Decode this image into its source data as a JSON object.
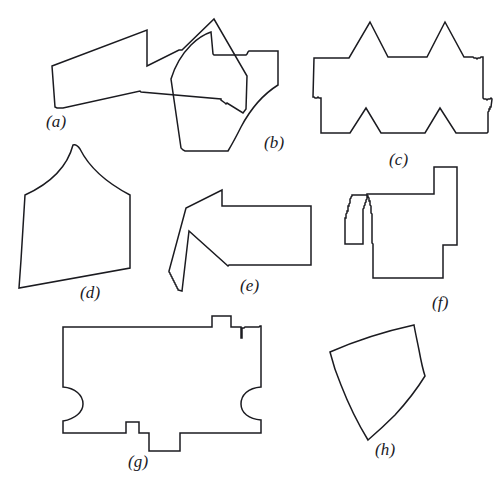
{
  "figure": {
    "background_color": "#ffffff",
    "stroke_color": "#1b1b20",
    "stroke_width": 1.5,
    "width": 501,
    "height": 491
  },
  "shapes": [
    {
      "id": "a",
      "caption": "(a)",
      "name": "notched-polygon",
      "description": "Irregular polygon with a deep V notch at the top",
      "caption_x": 46,
      "caption_y": 112,
      "path": "M 52 66 L 147 30 L 147 66 L 179 50 L 182 50 L 214 19 L 247 76 L 246 109 L 243 113 L 227 103 L 226 104 L 225 103 L 221 100 L 221 99 L 141 92 L 140 91 L 63 108 L 57 108 L 55 107 Z"
    },
    {
      "id": "b",
      "caption": "(b)",
      "name": "curved-notched-polygon",
      "description": "Polygon with concave right curve and a narrow slit at the top left",
      "caption_x": 264,
      "caption_y": 133,
      "path": "M 211 32 L 213 54 L 214 55 L 246 55 L 247 54 L 248 52 L 249 51 L 278 51 L 278 85 C 262 95 250 110 241 127 C 235 139 231 146 228 151 L 185 151 L 183 150 L 181 148 L 171 79 C 175 66 182 54 191 45 C 198 38 205 34 211 32 Z"
    },
    {
      "id": "c",
      "caption": "(c)",
      "name": "star-gear-polygon",
      "description": "Spiky star/gear-like rectilinear polygon with triangular teeth",
      "caption_x": 389,
      "caption_y": 150,
      "path": "M 370 22 L 388 57 L 427 57 L 445 22 L 464 57 L 473 57 L 474 58 L 476 58 L 477 59 L 478 58 L 480 58 L 481 57 L 483 57 L 483 98 L 484 99 L 486 99 L 487 100 L 488 99 L 490 99 L 491 98 L 492 99 L 491 107 L 490 107 L 490 109 L 489 109 L 489 111 L 488 112 L 488 132 L 487 133 L 456 133 L 440 108 L 425 133 L 381 133 L 366 108 L 350 133 L 321 133 L 321 98 L 319 98 L 318 97 L 317 98 L 315 98 L 314 97 L 313 97 L 314 58 L 349 58 Z"
    },
    {
      "id": "d",
      "caption": "(d)",
      "name": "onion-dome-shape",
      "description": "Dome or onion-shaped outline with a pointed apex and curved sides",
      "caption_x": 80,
      "caption_y": 283,
      "path": "M 73 145 C 67 168 49 184 25 195 L 21 260 L 19 288 L 130 268 L 130 195 C 107 183 89 167 80 149 C 78 146 76 144 73 145 Z"
    },
    {
      "id": "e",
      "caption": "(e)",
      "name": "arrow-notch-polygon",
      "description": "Rectangular polygon with a pointed notch cut into the bottom left",
      "caption_x": 240,
      "caption_y": 276,
      "path": "M 222 190 L 222 206 L 311 206 L 311 265 L 229 265 L 228 266 L 189 231 L 182 291 L 178 290 L 178 289 L 177 288 L 177 287 L 176 286 L 176 285 L 175 284 L 175 283 L 174 282 L 174 281 L 173 280 L 173 279 L 172 278 L 172 277 L 171 276 L 171 275 L 170 274 L 170 273 L 169 272 L 169 271 L 186 208 Z"
    },
    {
      "id": "f",
      "caption": "(f)",
      "name": "rectilinear-staircase-polygon",
      "description": "Orthogonal polygon with a tall vertical tab and a square notch",
      "caption_x": 432,
      "caption_y": 293,
      "path": "M 457 167 L 457 245 L 443 245 L 443 278 L 373 278 L 373 244 L 372 243 L 372 214 L 371 213 L 371 206 L 370 205 L 370 201 L 369 201 L 369 198 L 368 197 L 368 196 L 367 196 L 367 199 L 366 200 L 366 202 L 365 203 L 365 205 L 364 206 L 364 208 L 363 209 L 363 244 L 345 244 L 345 218 L 346 218 L 346 214 L 347 213 L 347 211 L 348 211 L 348 206 L 349 206 L 349 204 L 350 203 L 350 199 L 351 198 L 351 197 L 352 196 L 352 195 L 367 195 L 367 194 L 368 194 L 434 194 L 434 167 Z"
    },
    {
      "id": "g",
      "caption": "(g)",
      "name": "puzzle-piece-shape",
      "description": "Wide rectangle with semicircular notches on left and right sides and rectangular tabs",
      "caption_x": 128,
      "caption_y": 452,
      "path": "M 63 327 L 212 327 L 212 316 L 231 316 L 231 327 L 241 327 L 241 338 L 242 338 L 242 328 L 244 328 L 245 327 L 259 327 L 260 326 L 261 326 L 261 387 C 248 388 241 395 241 404 C 241 413 249 419 261 420 L 261 433 L 180 433 L 180 451 L 149 451 L 149 433 L 139 433 L 139 422 L 126 422 L 126 433 L 63 433 L 63 421 C 75 419 83 412 83 404 C 83 395 75 388 63 387 Z"
    },
    {
      "id": "h",
      "caption": "(h)",
      "name": "curved-quadrilateral",
      "description": "Quadrilateral with curved concave and convex sides",
      "caption_x": 375,
      "caption_y": 440,
      "path": "M 330 352 C 355 341 382 332 414 325 C 415 331 417 340 419 350 C 421 361 423 370 425 376 C 417 389 406 403 395 415 C 385 425 375 434 368 440 C 357 422 348 403 341 385 C 335 371 332 360 330 352 Z"
    }
  ]
}
